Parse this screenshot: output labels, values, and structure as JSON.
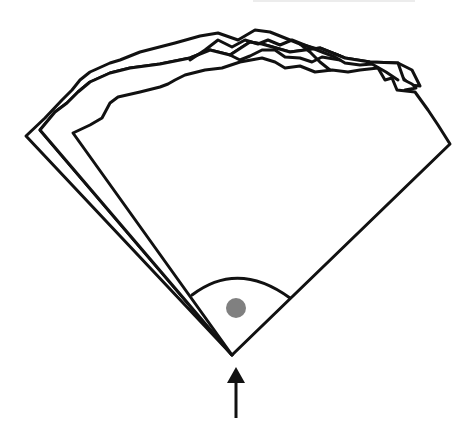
{
  "figure": {
    "colors": {
      "background": "#ffffff",
      "ink": "#111111",
      "dot": "#808080",
      "top_strip": "#ececec"
    },
    "apex": [
      232,
      355
    ],
    "dot": {
      "cx": 236,
      "cy": 308,
      "r": 10
    },
    "arrow": {
      "tip": [
        236,
        367
      ],
      "tail": [
        236,
        418
      ]
    },
    "sheet_count": 3
  }
}
